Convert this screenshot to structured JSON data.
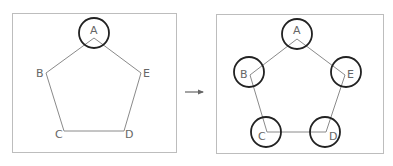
{
  "diagram": {
    "left_panel": {
      "labels": {
        "A": "A",
        "B": "B",
        "C": "C",
        "D": "D",
        "E": "E"
      },
      "circled": [
        "A"
      ]
    },
    "arrow": "→",
    "right_panel": {
      "labels": {
        "A": "A",
        "B": "B",
        "C": "C",
        "D": "D",
        "E": "E"
      },
      "circled": [
        "A",
        "B",
        "C",
        "D",
        "E"
      ]
    },
    "colors": {
      "frame": "#bdbdbd",
      "edge": "#8a8a8a",
      "circle": "#222222",
      "label": "#666666",
      "arrow": "#666666"
    }
  }
}
